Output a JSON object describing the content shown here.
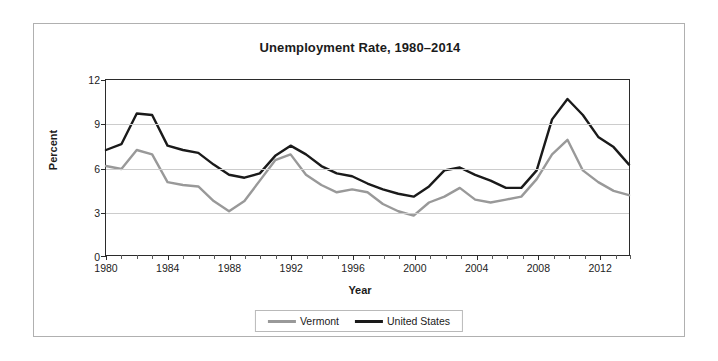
{
  "figure": {
    "title": "Unemployment Rate, 1980–2014",
    "xlabel": "Year",
    "ylabel": "Percent"
  },
  "colors": {
    "vermont": "#999999",
    "united_states": "#1a1a1a",
    "gridline": "#cccccc",
    "axis": "#2b2b2b",
    "frame": "#b0b0b0",
    "text": "#1b1b1b"
  },
  "legend": {
    "position": "bottom-center",
    "entries": [
      {
        "label": "Vermont",
        "color": "#999999"
      },
      {
        "label": "United States",
        "color": "#1a1a1a"
      }
    ]
  },
  "axes": {
    "y_ticks": [
      "0",
      "3",
      "6",
      "9",
      "12"
    ],
    "x_major_ticks": [
      "1980",
      "1984",
      "1988",
      "1992",
      "1996",
      "2000",
      "2004",
      "2008",
      "2012"
    ]
  },
  "chart_data": {
    "type": "line",
    "title": "Unemployment Rate, 1980–2014",
    "xlabel": "Year",
    "ylabel": "Percent",
    "xlim": [
      1980,
      2014
    ],
    "ylim": [
      0,
      12
    ],
    "grid": true,
    "legend_position": "bottom-center",
    "x": [
      1980,
      1981,
      1982,
      1983,
      1984,
      1985,
      1986,
      1987,
      1988,
      1989,
      1990,
      1991,
      1992,
      1993,
      1994,
      1995,
      1996,
      1997,
      1998,
      1999,
      2000,
      2001,
      2002,
      2003,
      2004,
      2005,
      2006,
      2007,
      2008,
      2009,
      2010,
      2011,
      2012,
      2013,
      2014
    ],
    "series": [
      {
        "name": "Vermont",
        "color": "#999999",
        "values": [
          6.1,
          5.9,
          7.2,
          6.9,
          5.0,
          4.8,
          4.7,
          3.7,
          3.0,
          3.7,
          5.1,
          6.5,
          6.9,
          5.5,
          4.8,
          4.3,
          4.5,
          4.3,
          3.5,
          3.0,
          2.7,
          3.6,
          4.0,
          4.6,
          3.8,
          3.6,
          3.8,
          4.0,
          5.2,
          6.9,
          7.9,
          5.8,
          5.0,
          4.4,
          4.1
        ]
      },
      {
        "name": "United States",
        "color": "#1a1a1a",
        "values": [
          7.2,
          7.6,
          9.7,
          9.6,
          7.5,
          7.2,
          7.0,
          6.2,
          5.5,
          5.3,
          5.6,
          6.8,
          7.5,
          6.9,
          6.1,
          5.6,
          5.4,
          4.9,
          4.5,
          4.2,
          4.0,
          4.7,
          5.8,
          6.0,
          5.5,
          5.1,
          4.6,
          4.6,
          5.8,
          9.3,
          10.7,
          9.6,
          8.1,
          7.4,
          6.2
        ]
      }
    ]
  }
}
